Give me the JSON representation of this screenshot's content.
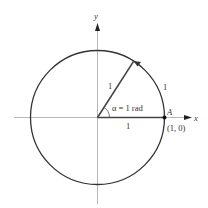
{
  "diagram": {
    "axes": {
      "x_label": "x",
      "y_label": "y"
    },
    "circle": {
      "type": "unit-circle"
    },
    "radius_label": "1",
    "arc_label": "1",
    "base_label": "1",
    "angle_label": "α = 1 rad",
    "point": {
      "name": "A",
      "coords": "(1, 0)"
    },
    "colors": {
      "stroke": "#333333",
      "axis": "#888888",
      "background": "#ffffff"
    }
  }
}
